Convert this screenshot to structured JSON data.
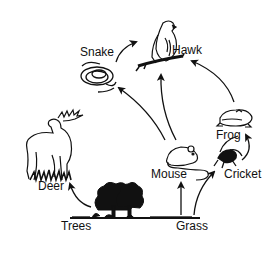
{
  "diagram": {
    "type": "food-web",
    "organisms": [
      {
        "id": "hawk",
        "label": "Hawk"
      },
      {
        "id": "snake",
        "label": "Snake"
      },
      {
        "id": "deer",
        "label": "Deer"
      },
      {
        "id": "frog",
        "label": "Frog"
      },
      {
        "id": "mouse",
        "label": "Mouse"
      },
      {
        "id": "cricket",
        "label": "Cricket"
      },
      {
        "id": "trees",
        "label": "Trees"
      },
      {
        "id": "grass",
        "label": "Grass"
      }
    ],
    "arrows": [
      {
        "from": "Trees",
        "to": "Deer"
      },
      {
        "from": "Grass",
        "to": "Mouse"
      },
      {
        "from": "Grass",
        "to": "Cricket"
      },
      {
        "from": "Cricket",
        "to": "Frog"
      },
      {
        "from": "Mouse",
        "to": "Snake"
      },
      {
        "from": "Mouse",
        "to": "Hawk"
      },
      {
        "from": "Frog",
        "to": "Hawk"
      },
      {
        "from": "Snake",
        "to": "Hawk"
      }
    ],
    "colors": {
      "ink": "#111111",
      "background": "#ffffff"
    }
  }
}
